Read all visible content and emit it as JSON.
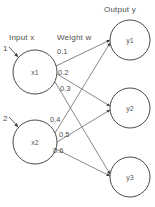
{
  "diagram": {
    "background_color": "#ffffff",
    "stroke_color": "#4a4a4a",
    "text_color": "#4f4f4f",
    "section_labels": {
      "input": "Input x",
      "weight": "Weight w",
      "output": "Output y"
    },
    "input_indices": [
      {
        "text": "1"
      },
      {
        "text": "2"
      }
    ],
    "input_nodes": [
      {
        "label": "x1",
        "cx": 35,
        "cy": 72,
        "r": 22
      },
      {
        "label": "x2",
        "cx": 35,
        "cy": 142,
        "r": 22
      }
    ],
    "output_nodes": [
      {
        "label": "y1",
        "cx": 130,
        "cy": 40,
        "r": 20
      },
      {
        "label": "y2",
        "cx": 130,
        "cy": 108,
        "r": 20
      },
      {
        "label": "y3",
        "cx": 130,
        "cy": 177,
        "r": 20
      }
    ],
    "weights": [
      {
        "value": "0.1",
        "from": "x1",
        "to": "y1"
      },
      {
        "value": "0.2",
        "from": "x1",
        "to": "y2"
      },
      {
        "value": "0.3",
        "from": "x1",
        "to": "y3"
      },
      {
        "value": "0.4",
        "from": "x2",
        "to": "y1"
      },
      {
        "value": "0.5",
        "from": "x2",
        "to": "y2"
      },
      {
        "value": "0.6",
        "from": "x2",
        "to": "y3"
      }
    ]
  }
}
